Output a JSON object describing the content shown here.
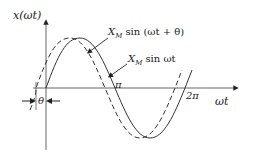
{
  "diagram": {
    "y_axis_label": "x(ωt)",
    "x_axis_label": "ωt",
    "tick_pi": "π",
    "tick_2pi": "2π",
    "theta_label": "θ",
    "curves": [
      {
        "name": "shifted",
        "style": "dashed",
        "label_main": "X",
        "label_sub": "M",
        "label_rest": " sin (ωt + θ)"
      },
      {
        "name": "reference",
        "style": "solid",
        "label_main": "X",
        "label_sub": "M",
        "label_rest": " sin ωt"
      }
    ],
    "colors": {
      "line": "#333333",
      "background": "#ffffff"
    }
  }
}
